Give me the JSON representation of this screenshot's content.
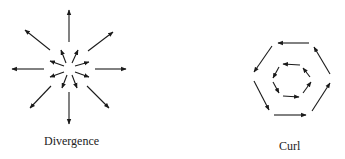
{
  "diagram": {
    "panels": [
      {
        "id": "divergence",
        "label": "Divergence",
        "center": [
          69,
          69
        ],
        "arrow_count_outer": 8,
        "arrow_count_inner": 8,
        "direction": "outward"
      },
      {
        "id": "curl",
        "label": "Curl",
        "center": [
          290,
          78
        ],
        "shape": "nested hexagons",
        "rotation": "counterclockwise"
      }
    ],
    "colors": {
      "ink": "#1a1a1a",
      "background": "#ffffff"
    }
  }
}
